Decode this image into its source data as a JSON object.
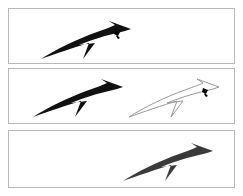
{
  "canvas": {
    "width": 243,
    "height": 196,
    "background": "#ffffff"
  },
  "style": {
    "panel_border_color": "#b9b9b9",
    "panel_background": "#ffffff",
    "arrow_fill_solid": "#111111",
    "arrow_fill_soft": "#3a3a3a",
    "arrow_outline_stroke": "#9a9a9a",
    "arrow_outline_fill": "none",
    "marker_color": "#000000"
  },
  "panels": [
    {
      "id": "panel-1",
      "name": "top-panel",
      "index": 1,
      "arrows": [
        {
          "name": "arrow-solid-left",
          "style": "solid",
          "fill": "#111111",
          "has_cursor_marker": true,
          "position": {
            "left": 30,
            "top": 10,
            "width": 96,
            "height": 42
          }
        }
      ]
    },
    {
      "id": "panel-2",
      "name": "middle-panel",
      "index": 2,
      "arrows": [
        {
          "name": "arrow-solid-left",
          "style": "solid",
          "fill": "#111111",
          "has_cursor_marker": false,
          "position": {
            "left": 22,
            "top": 8,
            "width": 96,
            "height": 42
          }
        },
        {
          "name": "arrow-outline-right",
          "style": "outline",
          "stroke": "#9a9a9a",
          "has_cursor_marker": true,
          "position": {
            "left": 118,
            "top": 8,
            "width": 96,
            "height": 42
          }
        }
      ]
    },
    {
      "id": "panel-3",
      "name": "bottom-panel",
      "index": 3,
      "arrows": [
        {
          "name": "arrow-soft-right",
          "style": "soft",
          "fill": "#3a3a3a",
          "has_cursor_marker": false,
          "position": {
            "left": 112,
            "top": 10,
            "width": 96,
            "height": 42
          }
        }
      ]
    }
  ]
}
